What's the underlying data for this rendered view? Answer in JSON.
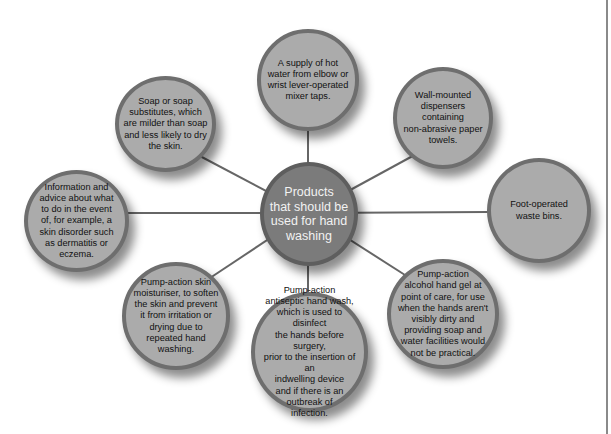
{
  "diagram": {
    "type": "hub-and-spoke",
    "colors": {
      "hub_fill": "#7b7b7b",
      "node_fill": "#ababab",
      "node_border": "#6e6e6e",
      "connector": "#666666"
    },
    "hub": {
      "label": "Products\nthat should be\nused for hand\nwashing"
    },
    "nodes": [
      {
        "id": "hot-water",
        "label": "A supply of hot\nwater from elbow or\nwrist lever-operated\nmixer taps."
      },
      {
        "id": "paper-towels",
        "label": "Wall-mounted\ndispensers\ncontaining\nnon-abrasive paper\ntowels."
      },
      {
        "id": "waste-bins",
        "label": "Foot-operated\nwaste bins."
      },
      {
        "id": "alcohol-gel",
        "label": "Pump-action\nalcohol hand gel at\npoint of care, for use\nwhen the hands aren't\nvisibly dirty and\nproviding soap and\nwater facilities would\nnot be practical."
      },
      {
        "id": "antiseptic-wash",
        "label": "Pump-action\nantiseptic hand wash,\nwhich is used to disinfect\nthe hands before surgery,\nprior to the insertion of an\nindwelling device\nand if there is an\noutbreak of\ninfection."
      },
      {
        "id": "moisturiser",
        "label": "Pump-action skin\nmoisturiser, to soften\nthe skin and prevent\nit from irritation or\ndrying due to\nrepeated hand\nwashing."
      },
      {
        "id": "information",
        "label": "Information and\nadvice about what\nto do in the event\nof, for example, a\nskin disorder such\nas dermatitis or\neczema."
      },
      {
        "id": "soap",
        "label": "Soap or soap\nsubstitutes, which\nare milder than soap\nand less likely to  dry\nthe skin."
      }
    ]
  }
}
